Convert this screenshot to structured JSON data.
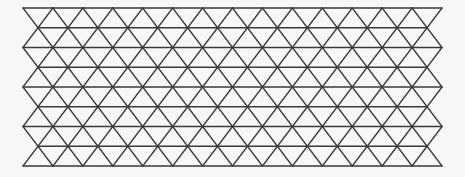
{
  "diagram": {
    "background": "#f7f7f6",
    "line_color": "#3a3a3a",
    "line_width": 1.3,
    "rows": 9,
    "top_y": 8,
    "row_spacing": 19.75,
    "even_row_start_x": 23,
    "even_row_vertices": 15,
    "odd_row_start_x": 38,
    "odd_row_vertices": 14,
    "col_spacing": 29.93
  }
}
